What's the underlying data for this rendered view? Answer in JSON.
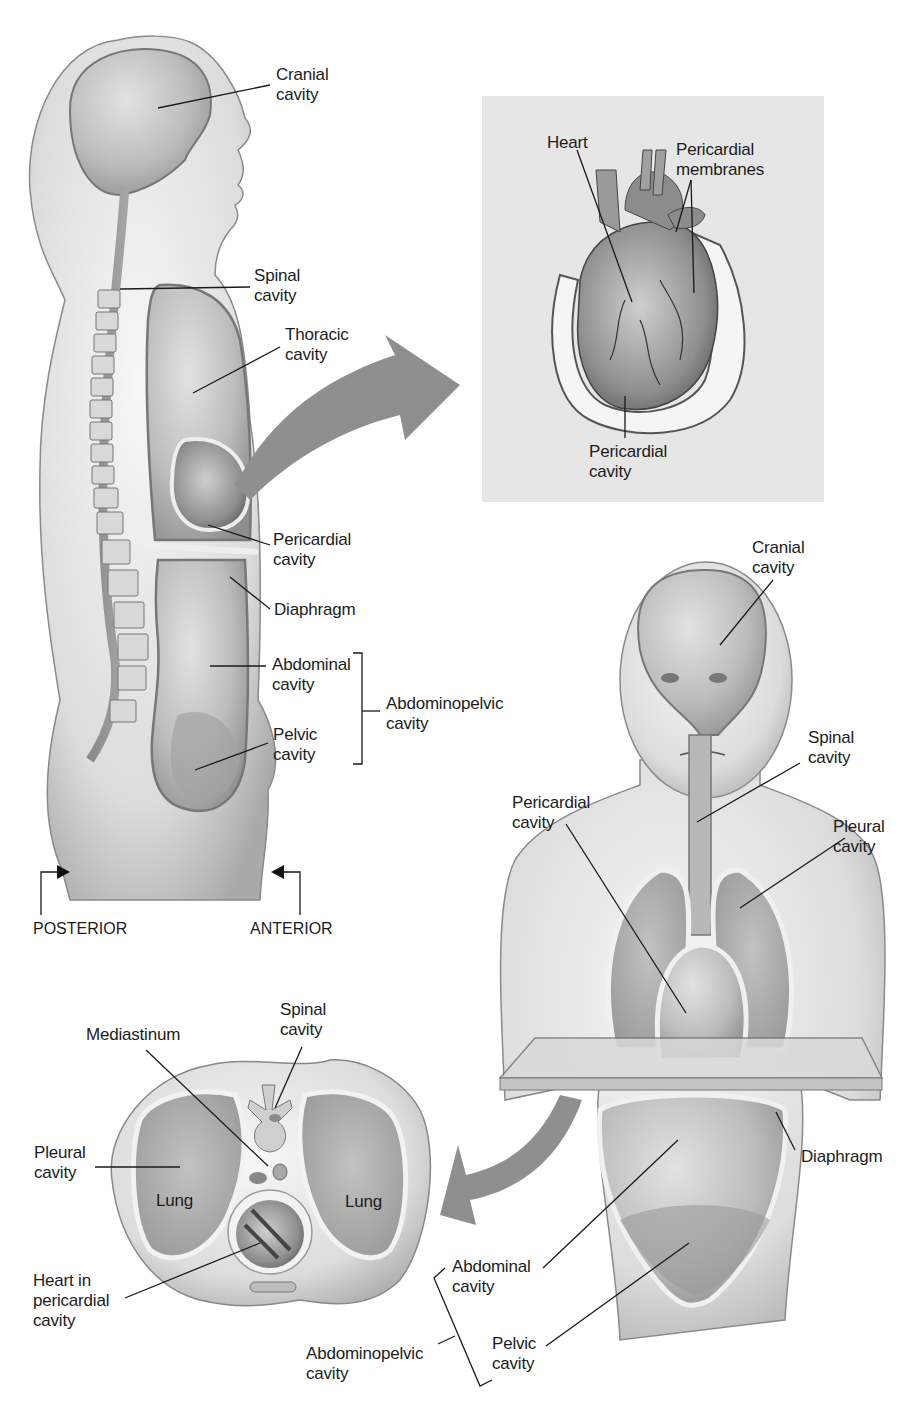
{
  "sagittal_view": {
    "labels": {
      "cranial_cavity": "Cranial\ncavity",
      "spinal_cavity": "Spinal\ncavity",
      "thoracic_cavity": "Thoracic\ncavity",
      "pericardial_cavity": "Pericardial\ncavity",
      "diaphragm": "Diaphragm",
      "abdominal_cavity": "Abdominal\ncavity",
      "pelvic_cavity": "Pelvic\ncavity",
      "abdominopelvic_cavity": "Abdominopelvic\ncavity"
    },
    "directions": {
      "posterior": "POSTERIOR",
      "anterior": "ANTERIOR"
    }
  },
  "heart_inset": {
    "background": "#e6e6e6",
    "labels": {
      "heart": "Heart",
      "pericardial_membranes": "Pericardial\nmembranes",
      "pericardial_cavity": "Pericardial\ncavity"
    }
  },
  "anterior_view": {
    "labels": {
      "cranial_cavity": "Cranial\ncavity",
      "spinal_cavity": "Spinal\ncavity",
      "pericardial_cavity": "Pericardial\ncavity",
      "pleural_cavity": "Pleural\ncavity",
      "diaphragm": "Diaphragm",
      "abdominal_cavity": "Abdominal\ncavity",
      "pelvic_cavity": "Pelvic\ncavity",
      "abdominopelvic_cavity": "Abdominopelvic\ncavity"
    }
  },
  "cross_section": {
    "labels": {
      "spinal_cavity": "Spinal\ncavity",
      "mediastinum": "Mediastinum",
      "pleural_cavity": "Pleural\ncavity",
      "lung_left": "Lung",
      "lung_right": "Lung",
      "heart_in_pericardial_cavity": "Heart in\npericardial\ncavity"
    }
  },
  "colors": {
    "skin_light": "#efefef",
    "skin_mid": "#cfcfcf",
    "cavity": "#bdbdbd",
    "cavity_dark": "#9a9a9a",
    "outline": "#555555",
    "arrow": "#8f8f8f",
    "leader": "#1a1a1a"
  }
}
